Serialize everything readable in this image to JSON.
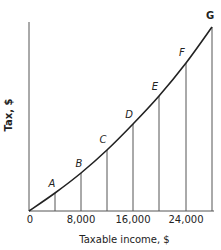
{
  "chart_data": {
    "type": "line",
    "title": "",
    "xlabel": "Taxable income, $",
    "ylabel": "Tax, $",
    "x_ticks": [
      "0",
      "8,000",
      "16,000",
      "24,000"
    ],
    "x_tick_values": [
      0,
      8000,
      16000,
      24000
    ],
    "xlim": [
      0,
      28000
    ],
    "y_ticks": [],
    "grid": false,
    "legend": null,
    "series": [
      {
        "name": "Tax curve",
        "points": [
          {
            "label": "0",
            "x": 0,
            "y": 0
          },
          {
            "label": "A",
            "x": 4000,
            "y": 10
          },
          {
            "label": "B",
            "x": 8000,
            "y": 21
          },
          {
            "label": "C",
            "x": 12000,
            "y": 33
          },
          {
            "label": "D",
            "x": 16000,
            "y": 47
          },
          {
            "label": "E",
            "x": 20000,
            "y": 63
          },
          {
            "label": "F",
            "x": 24000,
            "y": 80
          },
          {
            "label": "G",
            "x": 28000,
            "y": 100
          }
        ]
      }
    ],
    "annotations": [
      "Vertical drop lines from points A–G to x-axis",
      "y values are relative heights (G = 100); y-axis has no tick labels"
    ]
  },
  "axis": {
    "origin_label": "0",
    "x_title": "Taxable income, $",
    "y_title": "Tax, $",
    "ticks": [
      {
        "label": "8,000",
        "px": 81
      },
      {
        "label": "16,000",
        "px": 133
      },
      {
        "label": "24,000",
        "px": 186
      }
    ]
  },
  "points": [
    {
      "label": "A",
      "px": 55,
      "py": 193,
      "lx": 52,
      "ly": 189
    },
    {
      "label": "B",
      "px": 81,
      "py": 173,
      "lx": 79,
      "ly": 169
    },
    {
      "label": "C",
      "px": 107,
      "py": 150,
      "lx": 103,
      "ly": 145
    },
    {
      "label": "D",
      "px": 133,
      "py": 124,
      "lx": 129,
      "ly": 120
    },
    {
      "label": "E",
      "px": 159,
      "py": 96,
      "lx": 155,
      "ly": 92
    },
    {
      "label": "F",
      "px": 186,
      "py": 63,
      "lx": 182,
      "ly": 58
    },
    {
      "label": "G",
      "px": 212,
      "py": 27,
      "lx": 210,
      "ly": 21
    }
  ],
  "colors": {
    "ink": "#222222",
    "axis": "#555555",
    "background": "#ffffff"
  }
}
